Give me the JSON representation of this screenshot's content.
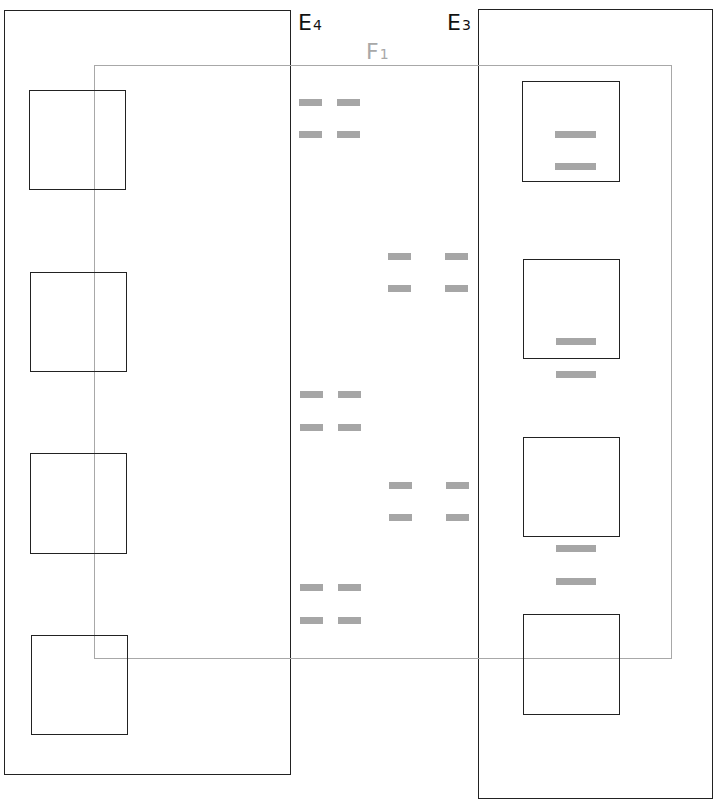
{
  "diagram": {
    "colors": {
      "region_border": "#222222",
      "overlap_border": "#a8a8a8",
      "square_border": "#222222",
      "dash_fill": "#a6a6a6",
      "background": "#ffffff"
    },
    "labels": {
      "e4": {
        "main": "E",
        "sub": "4"
      },
      "e3": {
        "main": "E",
        "sub": "3"
      },
      "f1": {
        "main": "F",
        "sub": "1"
      }
    },
    "regions": [
      {
        "id": "E4",
        "x": 4,
        "y": 10,
        "w": 287,
        "h": 765
      },
      {
        "id": "E3",
        "x": 478,
        "y": 9,
        "w": 235,
        "h": 790
      },
      {
        "id": "F1",
        "x": 94,
        "y": 65,
        "w": 578,
        "h": 594
      }
    ],
    "left_squares": [
      {
        "x": 29,
        "y": 90,
        "w": 97,
        "h": 100
      },
      {
        "x": 30,
        "y": 272,
        "w": 97,
        "h": 100
      },
      {
        "x": 30,
        "y": 453,
        "w": 97,
        "h": 101
      },
      {
        "x": 31,
        "y": 635,
        "w": 97,
        "h": 100
      }
    ],
    "right_squares": [
      {
        "x": 522,
        "y": 81,
        "w": 98,
        "h": 101
      },
      {
        "x": 523,
        "y": 259,
        "w": 97,
        "h": 100
      },
      {
        "x": 523,
        "y": 437,
        "w": 97,
        "h": 100
      },
      {
        "x": 523,
        "y": 614,
        "w": 97,
        "h": 101
      }
    ],
    "center_dashes": [
      {
        "x": 299,
        "y": 99,
        "w": 23,
        "h": 7
      },
      {
        "x": 337,
        "y": 99,
        "w": 23,
        "h": 7
      },
      {
        "x": 299,
        "y": 131,
        "w": 23,
        "h": 7
      },
      {
        "x": 337,
        "y": 131,
        "w": 23,
        "h": 7
      },
      {
        "x": 388,
        "y": 253,
        "w": 23,
        "h": 7
      },
      {
        "x": 445,
        "y": 253,
        "w": 23,
        "h": 7
      },
      {
        "x": 388,
        "y": 285,
        "w": 23,
        "h": 7
      },
      {
        "x": 445,
        "y": 285,
        "w": 23,
        "h": 7
      },
      {
        "x": 300,
        "y": 391,
        "w": 23,
        "h": 7
      },
      {
        "x": 338,
        "y": 391,
        "w": 23,
        "h": 7
      },
      {
        "x": 300,
        "y": 424,
        "w": 23,
        "h": 7
      },
      {
        "x": 338,
        "y": 424,
        "w": 23,
        "h": 7
      },
      {
        "x": 389,
        "y": 482,
        "w": 23,
        "h": 7
      },
      {
        "x": 446,
        "y": 482,
        "w": 23,
        "h": 7
      },
      {
        "x": 389,
        "y": 514,
        "w": 23,
        "h": 7
      },
      {
        "x": 446,
        "y": 514,
        "w": 23,
        "h": 7
      },
      {
        "x": 300,
        "y": 584,
        "w": 23,
        "h": 7
      },
      {
        "x": 338,
        "y": 584,
        "w": 23,
        "h": 7
      },
      {
        "x": 300,
        "y": 617,
        "w": 23,
        "h": 7
      },
      {
        "x": 338,
        "y": 617,
        "w": 23,
        "h": 7
      }
    ],
    "right_dashes": [
      {
        "x": 555,
        "y": 131,
        "w": 41,
        "h": 7
      },
      {
        "x": 555,
        "y": 163,
        "w": 41,
        "h": 7
      },
      {
        "x": 556,
        "y": 338,
        "w": 40,
        "h": 7
      },
      {
        "x": 556,
        "y": 371,
        "w": 40,
        "h": 7
      },
      {
        "x": 556,
        "y": 545,
        "w": 40,
        "h": 7
      },
      {
        "x": 556,
        "y": 578,
        "w": 40,
        "h": 7
      }
    ]
  }
}
